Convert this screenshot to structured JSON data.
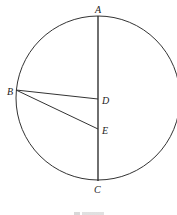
{
  "figure": {
    "type": "geometry-diagram",
    "circle": {
      "cx": 98,
      "cy": 98,
      "r": 82,
      "stroke": "#333333"
    },
    "points": {
      "A": {
        "label": "A",
        "x": 98,
        "y": 16
      },
      "B": {
        "label": "B",
        "x": 16,
        "y": 90
      },
      "C": {
        "label": "C",
        "x": 98,
        "y": 181
      },
      "D": {
        "label": "D",
        "x": 98,
        "y": 99
      },
      "E": {
        "label": "E",
        "x": 98,
        "y": 129
      }
    },
    "segments": [
      {
        "from": "A",
        "to": "C",
        "description": "diameter AC"
      },
      {
        "from": "B",
        "to": "D",
        "description": "segment BD"
      },
      {
        "from": "B",
        "to": "E",
        "description": "segment BE"
      }
    ],
    "caption": {
      "visible": "partially clipped"
    }
  }
}
